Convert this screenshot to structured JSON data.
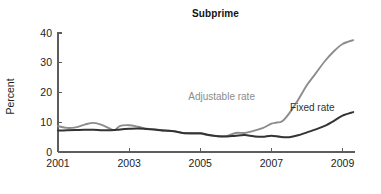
{
  "chart_data": {
    "type": "line",
    "title": "Subprime",
    "xlabel": "",
    "ylabel": "Percent",
    "xlim": [
      2001.0,
      2009.35
    ],
    "ylim": [
      0,
      40
    ],
    "yticks": [
      0,
      10,
      20,
      30,
      40
    ],
    "ytick_labels": [
      "0",
      "10",
      "20",
      "30",
      "40"
    ],
    "xticks": [
      2001,
      2003,
      2005,
      2007,
      2009
    ],
    "xtick_labels": [
      "2001",
      "2003",
      "2005",
      "2007",
      "2009"
    ],
    "grid": false,
    "legend_position": "inline-annotations",
    "annotations": [
      {
        "text": "Adjustable rate",
        "x": 2005.6,
        "y": 17.5,
        "color": "#8c8c8c"
      },
      {
        "text": "Fixed rate",
        "x": 2008.15,
        "y": 13.8,
        "color": "#333333"
      }
    ],
    "series": [
      {
        "name": "Adjustable rate",
        "color": "#8c8c8c",
        "width": 1.9,
        "x": [
          2001.0,
          2001.25,
          2001.5,
          2001.75,
          2002.0,
          2002.25,
          2002.5,
          2002.6,
          2002.75,
          2003.0,
          2003.25,
          2003.5,
          2003.75,
          2004.0,
          2004.25,
          2004.5,
          2004.75,
          2005.0,
          2005.25,
          2005.5,
          2005.75,
          2006.0,
          2006.25,
          2006.5,
          2006.75,
          2007.0,
          2007.15,
          2007.3,
          2007.5,
          2007.75,
          2008.0,
          2008.25,
          2008.5,
          2008.75,
          2009.0,
          2009.3
        ],
        "values": [
          8.7,
          8.1,
          8.3,
          9.2,
          9.8,
          9.0,
          7.6,
          7.4,
          8.8,
          9.0,
          8.5,
          7.8,
          7.6,
          7.2,
          7.0,
          6.4,
          6.2,
          6.2,
          5.6,
          5.3,
          5.4,
          6.4,
          6.4,
          7.1,
          8.0,
          9.5,
          9.9,
          10.3,
          13.0,
          17.5,
          22.5,
          26.5,
          30.5,
          33.8,
          36.3,
          37.6
        ]
      },
      {
        "name": "Fixed rate",
        "color": "#333333",
        "width": 2.0,
        "x": [
          2001.0,
          2001.25,
          2001.5,
          2001.75,
          2002.0,
          2002.25,
          2002.5,
          2002.6,
          2002.75,
          2003.0,
          2003.25,
          2003.5,
          2003.75,
          2004.0,
          2004.25,
          2004.5,
          2004.75,
          2005.0,
          2005.25,
          2005.5,
          2005.75,
          2006.0,
          2006.25,
          2006.5,
          2006.75,
          2007.0,
          2007.25,
          2007.5,
          2007.75,
          2008.0,
          2008.25,
          2008.5,
          2008.75,
          2009.0,
          2009.3
        ],
        "values": [
          7.2,
          7.3,
          7.4,
          7.5,
          7.5,
          7.3,
          7.3,
          7.4,
          7.6,
          7.8,
          7.9,
          7.7,
          7.5,
          7.2,
          7.0,
          6.4,
          6.3,
          6.3,
          5.7,
          5.3,
          5.2,
          5.5,
          5.7,
          5.3,
          5.1,
          5.5,
          5.1,
          5.0,
          5.6,
          6.6,
          7.6,
          8.8,
          10.4,
          12.2,
          13.4
        ]
      }
    ]
  },
  "geometry": {
    "plot_left": 58,
    "plot_right": 355,
    "plot_top": 33,
    "plot_bottom": 152,
    "tick_len": 4
  }
}
